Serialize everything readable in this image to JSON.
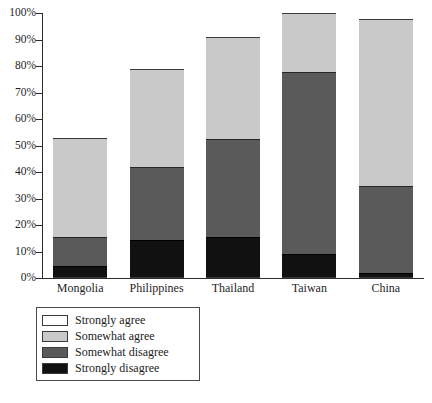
{
  "chart_data": {
    "type": "bar",
    "stacked": true,
    "stack_total": 100,
    "title": "",
    "subtitle": "",
    "xlabel": "",
    "ylabel": "",
    "ylim": [
      0,
      100
    ],
    "grid": false,
    "legend_position": "below-left",
    "categories": [
      "Mongolia",
      "Philippines",
      "Thailand",
      "Taiwan",
      "China"
    ],
    "tick_labels": {
      "y": [
        "0%",
        "10%",
        "20%",
        "30%",
        "40%",
        "50%",
        "60%",
        "70%",
        "80%",
        "90%",
        "100%"
      ],
      "y_values": [
        0,
        10,
        20,
        30,
        40,
        50,
        60,
        70,
        80,
        90,
        100
      ]
    },
    "series": [
      {
        "name": "Strongly disagree",
        "color": "#111111",
        "values": [
          4,
          14,
          15,
          8.5,
          1.5
        ]
      },
      {
        "name": "Somewhat disagree",
        "color": "#5a5a5a",
        "values": [
          11,
          27.5,
          37,
          69,
          33
        ]
      },
      {
        "name": "Somewhat agree",
        "color": "#c9c9c9",
        "values": [
          37.5,
          37,
          38.5,
          22,
          63
        ]
      },
      {
        "name": "Strongly agree",
        "color": "#ffffff",
        "values": [
          47.5,
          21.5,
          9.5,
          0.5,
          2.5
        ]
      }
    ],
    "cumulative_tops": {
      "Mongolia": {
        "strongly_disagree": 4,
        "somewhat_disagree": 15,
        "somewhat_agree": 52.5,
        "strongly_agree": 100
      },
      "Philippines": {
        "strongly_disagree": 14,
        "somewhat_disagree": 41.5,
        "somewhat_agree": 78.5,
        "strongly_agree": 100
      },
      "Thailand": {
        "strongly_disagree": 15,
        "somewhat_disagree": 52,
        "somewhat_agree": 90.5,
        "strongly_agree": 100
      },
      "Taiwan": {
        "strongly_disagree": 8.5,
        "somewhat_disagree": 77.5,
        "somewhat_agree": 99.5,
        "strongly_agree": 100
      },
      "China": {
        "strongly_disagree": 1.5,
        "somewhat_disagree": 34.5,
        "somewhat_agree": 97.5,
        "strongly_agree": 100
      }
    }
  },
  "legend": {
    "items": [
      {
        "label": "Strongly agree",
        "color": "#ffffff"
      },
      {
        "label": "Somewhat agree",
        "color": "#c9c9c9"
      },
      {
        "label": "Somewhat disagree",
        "color": "#5a5a5a"
      },
      {
        "label": "Strongly disagree",
        "color": "#111111"
      }
    ]
  }
}
